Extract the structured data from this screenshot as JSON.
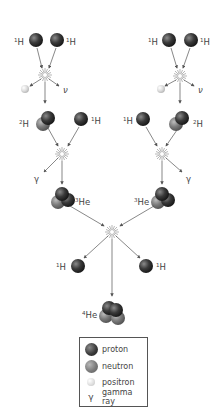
{
  "diagram": {
    "labels": {
      "h1": {
        "mass": "1",
        "symbol": "H"
      },
      "h2": {
        "mass": "2",
        "symbol": "H"
      },
      "he3": {
        "mass": "3",
        "symbol": "He"
      },
      "he4": {
        "mass": "4",
        "symbol": "He"
      },
      "neutrino": "ν",
      "gamma": "γ"
    },
    "colors": {
      "proton": "#2e2e2e",
      "neutron": "#7a7a7a",
      "positron": "#dcdcdc",
      "arrow": "#555555"
    },
    "steps": [
      "1H + 1H → 2H + e+ + ν",
      "2H + 1H → 3He + γ",
      "3He + 3He → 4He + 1H + 1H"
    ]
  },
  "legend": {
    "items": [
      {
        "icon": "proton-ball",
        "label": "proton"
      },
      {
        "icon": "neutron-ball",
        "label": "neutron"
      },
      {
        "icon": "positron-ball",
        "label": "positron"
      },
      {
        "icon": "gamma-symbol",
        "symbol": "γ",
        "label": "gamma ray"
      }
    ]
  }
}
